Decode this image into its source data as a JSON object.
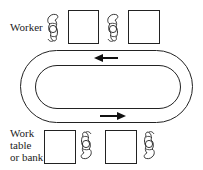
{
  "diagram": {
    "type": "assembly-line-layout",
    "labels": {
      "worker": "Worker",
      "work_table": [
        "Work",
        "table",
        "or bank"
      ]
    },
    "top_row": [
      {
        "kind": "worker",
        "facing": "right"
      },
      {
        "kind": "work-table"
      },
      {
        "kind": "worker",
        "facing": "right"
      },
      {
        "kind": "work-table"
      }
    ],
    "bottom_row": [
      {
        "kind": "work-table"
      },
      {
        "kind": "worker",
        "facing": "left"
      },
      {
        "kind": "work-table"
      },
      {
        "kind": "worker",
        "facing": "left"
      }
    ],
    "conveyor": {
      "shape": "oval-loop",
      "flow_top": "left",
      "flow_bottom": "right"
    },
    "colors": {
      "line": "#222222",
      "background": "#ffffff"
    }
  }
}
